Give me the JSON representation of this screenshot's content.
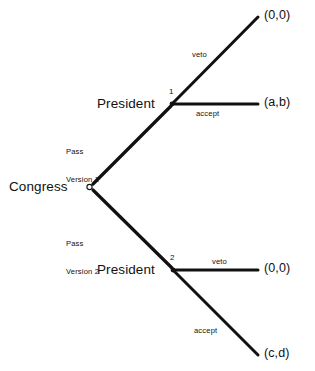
{
  "diagram": {
    "type": "game-tree",
    "title": "",
    "background_color": "#ffffff",
    "line_color": "#111111",
    "text_color": "#111111"
  },
  "nodes": {
    "root": {
      "player": "Congress",
      "index": "",
      "shape": "open-circle",
      "x": 88,
      "y": 187
    },
    "upper": {
      "player": "President",
      "index": "1",
      "shape": "filled-dot",
      "x": 172,
      "y": 104
    },
    "lower": {
      "player": "President",
      "index": "2",
      "shape": "filled-dot",
      "x": 173,
      "y": 270
    }
  },
  "actions": {
    "pass_version_1": "Pass\nVersion 1",
    "pass_version_1_line1": "Pass",
    "pass_version_1_line2": "Version 1",
    "pass_version_2": "Pass\nVersion 2",
    "pass_version_2_line1": "Pass",
    "pass_version_2_line2": "Version 2",
    "veto_upper": "veto",
    "accept_upper": "accept",
    "veto_lower": "veto",
    "accept_lower": "accept"
  },
  "payoffs": {
    "upper_veto": "(0,0)",
    "upper_accept": "(a,b)",
    "lower_veto": "(0,0)",
    "lower_accept": "(c,d)"
  },
  "edges": [
    {
      "name": "congress-to-president-1",
      "from": "root",
      "to": "upper",
      "label": "Pass\nVersion 1"
    },
    {
      "name": "congress-to-president-2",
      "from": "root",
      "to": "lower",
      "label": "Pass\nVersion 2"
    },
    {
      "name": "president-1-veto",
      "from": "upper",
      "to": "(0,0)",
      "label": "veto"
    },
    {
      "name": "president-1-accept",
      "from": "upper",
      "to": "(a,b)",
      "label": "accept"
    },
    {
      "name": "president-2-veto",
      "from": "lower",
      "to": "(0,0)",
      "label": "veto"
    },
    {
      "name": "president-2-accept",
      "from": "lower",
      "to": "(c,d)",
      "label": "accept"
    }
  ]
}
